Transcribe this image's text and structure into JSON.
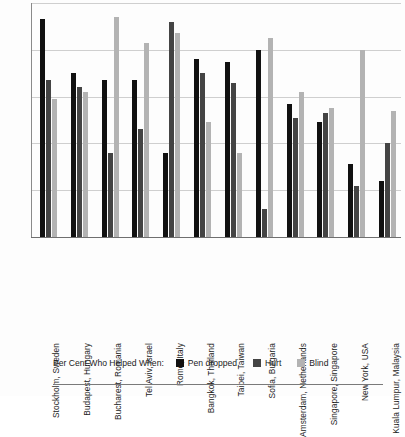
{
  "chart_data": {
    "type": "bar",
    "title": "",
    "xlabel": "",
    "ylabel": "",
    "ylim": [
      0,
      100
    ],
    "grid": true,
    "gridlines": [
      20,
      40,
      60,
      80,
      100
    ],
    "legend_position": "bottom",
    "legend_title": "Per Cent Who Helped When:",
    "categories": [
      "Stockholm, Sweden",
      "Budapest, Hungary",
      "Bucharest, Romania",
      "Tel Aviv, Israel",
      "Rome, Italy",
      "Bangkok, Thailand",
      "Taipei, Taiwan",
      "Sofia, Bulgaria",
      "Amsterdam, Netherlands",
      "Singapore, Singapore",
      "New York, USA",
      "Kuala Lumpur, Malaysia"
    ],
    "series": [
      {
        "name": "Pen dropped",
        "color": "#111111",
        "values": [
          93,
          70,
          67,
          67,
          36,
          76,
          75,
          80,
          57,
          49,
          31,
          24
        ]
      },
      {
        "name": "Hurt",
        "color": "#444444",
        "values": [
          67,
          64,
          36,
          46,
          92,
          70,
          66,
          12,
          51,
          53,
          22,
          40
        ]
      },
      {
        "name": "Blind",
        "color": "#b3b3b3",
        "values": [
          59,
          62,
          94,
          83,
          87,
          49,
          36,
          85,
          62,
          55,
          80,
          54
        ]
      }
    ]
  },
  "legend": {
    "title": "Per Cent Who Helped When:",
    "items": [
      {
        "label": "Pen dropped",
        "color": "#111111"
      },
      {
        "label": "Hurt",
        "color": "#444444"
      },
      {
        "label": "Blind",
        "color": "#b3b3b3"
      }
    ]
  }
}
